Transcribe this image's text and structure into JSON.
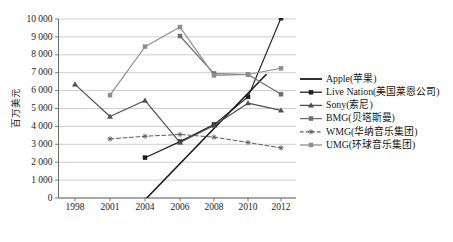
{
  "chart_data": {
    "type": "line",
    "title": "",
    "xlabel": "",
    "ylabel": "百万美元",
    "ylim": [
      0,
      10000
    ],
    "ytick_labels": [
      "0",
      "1 000",
      "2 000",
      "3 000",
      "4 000",
      "5 000",
      "6 000",
      "7 000",
      "8 000",
      "9 000",
      "10 000"
    ],
    "ytick_values": [
      0,
      1000,
      2000,
      3000,
      4000,
      5000,
      6000,
      7000,
      8000,
      9000,
      10000
    ],
    "categories": [
      1998,
      2001,
      2004,
      2006,
      2008,
      2010,
      2012
    ],
    "xtick_labels": [
      "1998",
      "2001",
      "2004",
      "2006",
      "2008",
      "2010",
      "2012"
    ],
    "grid": "horizontal",
    "legend_position": "right",
    "series": [
      {
        "name": "Apple(苹果)",
        "color": "#1b1b1b",
        "marker": "none",
        "dash": "solid",
        "x": [
          2004.1,
          2011.1
        ],
        "values": [
          0,
          6900
        ]
      },
      {
        "name": "Live Nation(美国莱恩公司)",
        "color": "#1f1f1f",
        "marker": "square",
        "dash": "solid",
        "x": [
          2004,
          2006,
          2008,
          2010,
          2012
        ],
        "values": [
          2250,
          3150,
          4100,
          5650,
          10050
        ]
      },
      {
        "name": "Sony(索尼)",
        "color": "#4f4f4f",
        "marker": "triangle",
        "dash": "solid",
        "x": [
          1998,
          2001,
          2004,
          2006,
          2008,
          2010,
          2012
        ],
        "values": [
          6350,
          4550,
          5450,
          3100,
          4050,
          5300,
          4900
        ]
      },
      {
        "name": "BMG(贝塔斯曼)",
        "color": "#6d6d6d",
        "marker": "square",
        "dash": "solid",
        "x": [
          2006,
          2008,
          2010,
          2012
        ],
        "values": [
          9050,
          6950,
          6900,
          5800
        ]
      },
      {
        "name": "WMG(华纳音乐集团)",
        "color": "#5b5b5b",
        "marker": "asterisk",
        "dash": "dashed",
        "x": [
          2001,
          2004,
          2006,
          2008,
          2010,
          2012
        ],
        "values": [
          3300,
          3450,
          3550,
          3400,
          3100,
          2800
        ]
      },
      {
        "name": "UMG(环球音乐集团)",
        "color": "#8e8e8e",
        "marker": "square",
        "dash": "solid",
        "x": [
          2001,
          2004,
          2006,
          2008,
          2010,
          2012
        ],
        "values": [
          5750,
          8450,
          9550,
          6850,
          6900,
          7250
        ]
      }
    ]
  },
  "legend": {
    "items": [
      {
        "label": "Apple(苹果)"
      },
      {
        "label": "Live Nation(美国莱恩公司)"
      },
      {
        "label": "Sony(索尼)"
      },
      {
        "label": "BMG(贝塔斯曼)"
      },
      {
        "label": "WMG(华纳音乐集团)"
      },
      {
        "label": "UMG(环球音乐集团)"
      }
    ]
  },
  "colors": {
    "grid": "#b9b9b9",
    "axis": "#5a5a5a",
    "text": "#1c1c1c",
    "background": "#ffffff"
  }
}
